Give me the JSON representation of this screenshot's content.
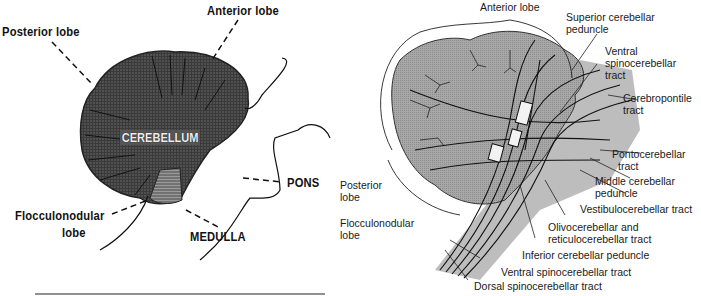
{
  "left_panel": {
    "labels": {
      "anterior_lobe": "Anterior lobe",
      "posterior_lobe": "Posterior lobe",
      "cerebellum": "CEREBELLUM",
      "pons": "PONS",
      "flocculonodular_lobe_line1": "Flocculonodular",
      "flocculonodular_lobe_line2": "lobe",
      "medulla": "MEDULLA"
    }
  },
  "right_panel": {
    "labels": {
      "anterior_lobe": "Anterior lobe",
      "superior_cerebellar_peduncle_line1": "Superior cerebellar",
      "superior_cerebellar_peduncle_line2": "peduncle",
      "ventral_spinocerebellar_tract_top_line1": "Ventral",
      "ventral_spinocerebellar_tract_top_line2": "spinocerebellar",
      "ventral_spinocerebellar_tract_top_line3": "tract",
      "cerebropontile_tract_line1": "Cerebropontile",
      "cerebropontile_tract_line2": "tract",
      "pontocerebellar_tract_line1": "Pontocerebellar",
      "pontocerebellar_tract_line2": "tract",
      "middle_cerebellar_peduncle_line1": "Middle cerebellar",
      "middle_cerebellar_peduncle_line2": "peduncle",
      "vestibulocerebellar_tract": "Vestibulocerebellar tract",
      "olivocerebellar_line1": "Olivocerebellar and",
      "olivocerebellar_line2": "reticulocerebellar tract",
      "inferior_cerebellar_peduncle": "Inferior cerebellar peduncle",
      "ventral_spinocerebellar_tract_bottom": "Ventral spinocerebellar tract",
      "dorsal_spinocerebellar_tract": "Dorsal spinocerebellar tract",
      "posterior_lobe_line1": "Posterior",
      "posterior_lobe_line2": "lobe",
      "flocculonodular_lobe_line1": "Flocculonodular",
      "flocculonodular_lobe_line2": "lobe"
    }
  }
}
